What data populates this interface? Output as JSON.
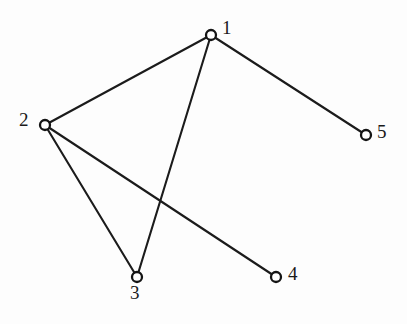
{
  "figure": {
    "name": "undirected-graph-5-nodes",
    "width": 407,
    "height": 324,
    "background_color": "#fdfdfd",
    "stroke_color": "#1b1b1b",
    "node_fill_color": "#ffffff",
    "node_stroke_color": "#141414",
    "label_color": "#1a1a1a",
    "node_radius": 5.0,
    "edge_width": 2.1
  },
  "chart_data": {
    "type": "diagram",
    "subtype": "node-link-graph",
    "directed": false,
    "title": "",
    "node_count": 5,
    "edge_count": 5,
    "nodes": [
      {
        "id": "1",
        "label": "1",
        "x": 211,
        "y": 35,
        "label_x": 222,
        "label_y": 18,
        "label_anchor": "right-top"
      },
      {
        "id": "2",
        "label": "2",
        "x": 45,
        "y": 125,
        "label_x": 19,
        "label_y": 110,
        "label_anchor": "left"
      },
      {
        "id": "3",
        "label": "3",
        "x": 137,
        "y": 277,
        "label_x": 130,
        "label_y": 283,
        "label_anchor": "below"
      },
      {
        "id": "4",
        "label": "4",
        "x": 276,
        "y": 277,
        "label_x": 288,
        "label_y": 264,
        "label_anchor": "right"
      },
      {
        "id": "5",
        "label": "5",
        "x": 366,
        "y": 135,
        "label_x": 377,
        "label_y": 122,
        "label_anchor": "right"
      }
    ],
    "edges": [
      {
        "source": "1",
        "target": "2",
        "x1": 211,
        "y1": 35,
        "x2": 45,
        "y2": 125
      },
      {
        "source": "1",
        "target": "3",
        "x1": 211,
        "y1": 35,
        "x2": 137,
        "y2": 277
      },
      {
        "source": "1",
        "target": "5",
        "x1": 211,
        "y1": 35,
        "x2": 366,
        "y2": 135
      },
      {
        "source": "2",
        "target": "3",
        "x1": 45,
        "y1": 125,
        "x2": 137,
        "y2": 277
      },
      {
        "source": "2",
        "target": "4",
        "x1": 45,
        "y1": 125,
        "x2": 276,
        "y2": 277
      }
    ],
    "adjacency": {
      "1": [
        "2",
        "3",
        "5"
      ],
      "2": [
        "1",
        "3",
        "4"
      ],
      "3": [
        "1",
        "2"
      ],
      "4": [
        "2"
      ],
      "5": [
        "1"
      ]
    },
    "degrees": {
      "1": 3,
      "2": 3,
      "3": 2,
      "4": 1,
      "5": 1
    },
    "crossings": [
      {
        "edge_a": "1-3",
        "edge_b": "2-4",
        "x": 160,
        "y": 198
      }
    ]
  }
}
